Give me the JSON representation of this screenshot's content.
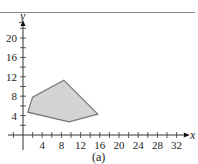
{
  "figure": {
    "caption": "(a)",
    "header_fragment": "igure"
  },
  "chart_data": {
    "type": "area",
    "title": "",
    "xlabel": "x",
    "ylabel": "y",
    "x_ticks": [
      4,
      8,
      12,
      16,
      20,
      24,
      28,
      32
    ],
    "y_ticks": [
      4,
      8,
      12,
      16,
      20
    ],
    "xlim": [
      0,
      33
    ],
    "ylim": [
      0,
      22
    ],
    "grid": false,
    "series": [
      {
        "name": "feasible region",
        "shape": "polygon",
        "vertices": [
          [
            1,
            4.7
          ],
          [
            2,
            7.8
          ],
          [
            8.5,
            11.3
          ],
          [
            15.6,
            4.3
          ],
          [
            9.6,
            2.7
          ]
        ],
        "fill": "#d3d3d3",
        "stroke": "#777777"
      }
    ]
  }
}
